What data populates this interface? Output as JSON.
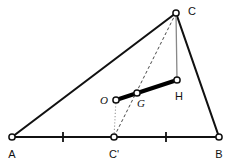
{
  "figure": {
    "canvas": {
      "width": 229,
      "height": 167
    },
    "colors": {
      "stroke": "#111111",
      "bold_stroke": "#000000",
      "thin_gray": "#888888",
      "dashed": "#333333",
      "dotted": "#999999",
      "node_fill": "#ffffff",
      "background": "#ffffff",
      "label": "#111111"
    },
    "points": [
      {
        "id": "A",
        "label": "A",
        "x": 12,
        "y": 137,
        "label_x": 12,
        "label_y": 158,
        "style": "upright"
      },
      {
        "id": "B",
        "label": "B",
        "x": 219,
        "y": 137,
        "label_x": 219,
        "label_y": 158,
        "style": "upright"
      },
      {
        "id": "C",
        "label": "C",
        "x": 176,
        "y": 13,
        "label_x": 192,
        "label_y": 15,
        "style": "upright"
      },
      {
        "id": "Cp",
        "label": "C'",
        "x": 114,
        "y": 137,
        "label_x": 114,
        "label_y": 158,
        "style": "upright"
      },
      {
        "id": "O",
        "label": "O",
        "x": 116,
        "y": 100,
        "label_x": 104,
        "label_y": 104,
        "style": "italic"
      },
      {
        "id": "G",
        "label": "G",
        "x": 137,
        "y": 93,
        "label_x": 141,
        "label_y": 107,
        "style": "italic"
      },
      {
        "id": "H",
        "label": "H",
        "x": 177,
        "y": 80,
        "label_x": 179,
        "label_y": 100,
        "style": "upright"
      }
    ],
    "segments": [
      {
        "id": "side-AB",
        "from": "A",
        "to": "B",
        "kind": "solid-thick"
      },
      {
        "id": "side-AC",
        "from": "A",
        "to": "C",
        "kind": "solid-thick"
      },
      {
        "id": "side-BC",
        "from": "B",
        "to": "C",
        "kind": "solid-thick"
      },
      {
        "id": "median-C-Cprime",
        "from": "C",
        "to": "Cp",
        "kind": "dashed"
      },
      {
        "id": "perp-bisector-O-Cprime",
        "from": "O",
        "to": "Cp",
        "kind": "dotted"
      },
      {
        "id": "altitude-C-H",
        "from": "C",
        "to": "H",
        "kind": "thin-gray"
      },
      {
        "id": "euler-line-O-H",
        "from": "O",
        "to": "H",
        "kind": "solid-bold"
      }
    ],
    "tick_marks": [
      {
        "id": "tick-midpoint-A-Cprime",
        "x": 63,
        "y": 137
      },
      {
        "id": "tick-midpoint-Cprime-B",
        "x": 166,
        "y": 137
      }
    ],
    "node_radius": 3.1,
    "tick_half_height": 5
  }
}
